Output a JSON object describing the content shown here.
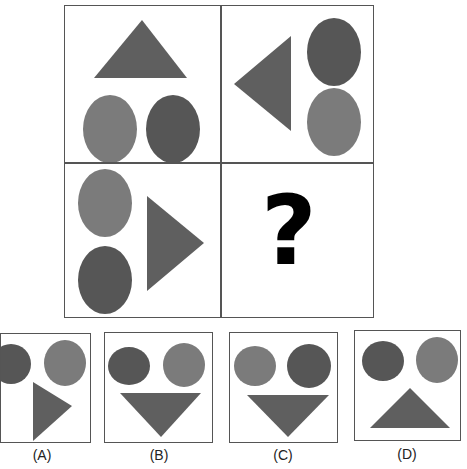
{
  "puzzle": {
    "colors": {
      "light": "#7b7b7b",
      "dark": "#565656",
      "triangle": "#5f5f5f",
      "border": "#555555"
    },
    "grid": [
      {
        "position": "top-left",
        "triangle": "up",
        "circles": [
          "light",
          "dark"
        ],
        "layout": "triangle-top"
      },
      {
        "position": "top-right",
        "triangle": "left",
        "circles": [
          "dark",
          "light"
        ],
        "layout": "triangle-left"
      },
      {
        "position": "bottom-left",
        "triangle": "right",
        "circles": [
          "light",
          "dark"
        ],
        "layout": "triangle-right"
      },
      {
        "position": "bottom-right",
        "missing": true,
        "symbol": "?"
      }
    ],
    "options": [
      {
        "label": "(A)",
        "circles": [
          "dark",
          "light"
        ],
        "triangle": "right"
      },
      {
        "label": "(B)",
        "circles": [
          "dark",
          "light"
        ],
        "triangle": "down"
      },
      {
        "label": "(C)",
        "circles": [
          "light",
          "dark"
        ],
        "triangle": "down"
      },
      {
        "label": "(D)",
        "circles": [
          "dark",
          "light"
        ],
        "triangle": "up"
      }
    ]
  }
}
